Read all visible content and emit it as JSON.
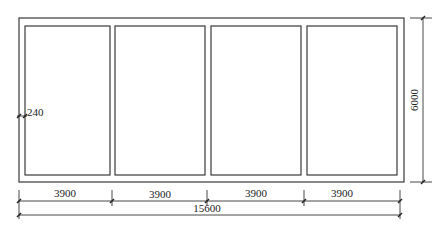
{
  "drawing": {
    "type": "floor-plan",
    "wall_thickness_label": "240",
    "bay_count": 4,
    "bays": [
      {
        "label": "3900"
      },
      {
        "label": "3900"
      },
      {
        "label": "3900"
      },
      {
        "label": "3900"
      }
    ],
    "total_length_label": "15600",
    "depth_label": "6000",
    "line_color": "#3a3a3a"
  }
}
